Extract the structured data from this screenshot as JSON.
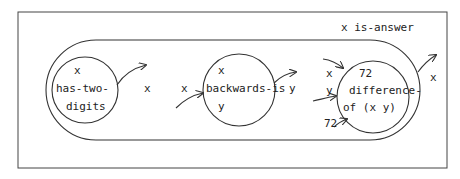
{
  "diagram": {
    "type": "flow-diagram",
    "outer_label": "x is-answer",
    "colors": {
      "stroke": "#333333",
      "text": "#222222",
      "background": "#ffffff"
    },
    "nodes": [
      {
        "id": "has-two-digits",
        "lines": [
          "x",
          "has-two-",
          "digits"
        ]
      },
      {
        "id": "backwards-is",
        "lines": [
          "x",
          "backwards-is",
          "y"
        ]
      },
      {
        "id": "difference-of",
        "lines": [
          "72",
          "difference-",
          "of (x y)"
        ]
      }
    ],
    "edge_labels": {
      "out_has_two_digits": "x",
      "in_backwards_is": "x",
      "out_backwards_is": "y",
      "in_diff_x": "x",
      "in_diff_y": "y",
      "in_diff_72": "72",
      "out_is_answer": "x"
    }
  }
}
